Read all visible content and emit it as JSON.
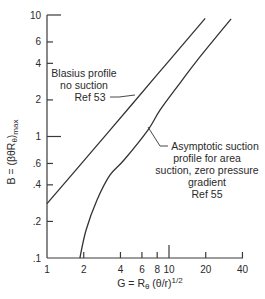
{
  "chart_data": {
    "type": "line",
    "title": "",
    "xlabel": "G = R_θ (θ/r)^1/2",
    "ylabel": "B = (βθR_θ)_max",
    "xscale": "log",
    "yscale": "log",
    "xlim": [
      1,
      40
    ],
    "ylim": [
      0.1,
      10
    ],
    "grid": false,
    "legend": "none (inline annotations)",
    "x_ticks": [
      {
        "value": 1,
        "label": "1",
        "major": true
      },
      {
        "value": 2,
        "label": "2",
        "major": false
      },
      {
        "value": 4,
        "label": "4",
        "major": false
      },
      {
        "value": 6,
        "label": "6",
        "major": false
      },
      {
        "value": 8,
        "label": "8",
        "major": false
      },
      {
        "value": 10,
        "label": "10",
        "major": true
      },
      {
        "value": 20,
        "label": "20",
        "major": false
      },
      {
        "value": 40,
        "label": "40",
        "major": false
      }
    ],
    "y_ticks": [
      {
        "value": 0.1,
        "label": ".1",
        "major": true
      },
      {
        "value": 0.2,
        "label": ".2",
        "major": false
      },
      {
        "value": 0.4,
        "label": ".4",
        "major": false
      },
      {
        "value": 0.6,
        "label": ".6",
        "major": false
      },
      {
        "value": 1,
        "label": "1",
        "major": true
      },
      {
        "value": 2,
        "label": "2",
        "major": false
      },
      {
        "value": 4,
        "label": "4",
        "major": false
      },
      {
        "value": 6,
        "label": "6",
        "major": false
      },
      {
        "value": 10,
        "label": "10",
        "major": true
      }
    ],
    "series": [
      {
        "name": "Blasius profile no suction Ref 53",
        "x": [
          1,
          2,
          5,
          10,
          19.8
        ],
        "y": [
          0.28,
          0.63,
          1.85,
          4.2,
          9.4
        ]
      },
      {
        "name": "Asymptotic suction profile for area suction, zero pressure gradient Ref 55",
        "x": [
          1.86,
          2.09,
          2.57,
          3.28,
          4.28,
          6.72,
          8.44,
          12.3,
          16.9,
          32.3
        ],
        "y": [
          0.1,
          0.17,
          0.3,
          0.48,
          0.64,
          1.13,
          1.65,
          2.75,
          4.2,
          9.3
        ]
      }
    ],
    "annotations": [
      {
        "series": 0,
        "lines": [
          "Blasius profile",
          "no suction",
          "Ref 53"
        ]
      },
      {
        "series": 1,
        "lines": [
          "Asymptotic suction",
          "profile for area",
          "suction, zero pressure",
          "gradient",
          "Ref 55"
        ]
      }
    ]
  },
  "labels": {
    "x_axis_main": "G = R",
    "x_axis_sub": "θ",
    "x_axis_rest": " (θ/r)",
    "x_axis_sup": "1/2",
    "y_axis_main": "B = (βθR",
    "y_axis_sub": "θ",
    "y_axis_close": ")",
    "y_axis_sub2": "max",
    "blasius": [
      "Blasius profile",
      "no suction",
      "Ref 53"
    ],
    "asymptotic": [
      "Asymptotic suction",
      "profile for area",
      "suction, zero pressure",
      "gradient",
      "Ref 55"
    ]
  }
}
